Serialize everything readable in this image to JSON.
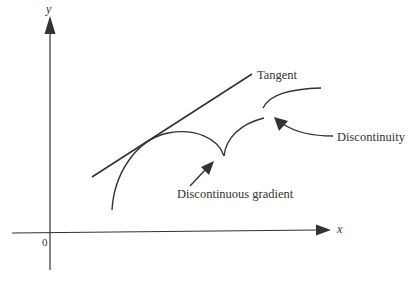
{
  "diagram": {
    "axes": {
      "x_label": "x",
      "y_label": "y",
      "origin_label": "0"
    },
    "annotations": {
      "tangent": "Tangent",
      "discontinuity": "Discontinuity",
      "discontinuous_gradient": "Discontinuous gradient"
    },
    "colors": {
      "stroke": "#333333",
      "background": "#ffffff"
    }
  }
}
